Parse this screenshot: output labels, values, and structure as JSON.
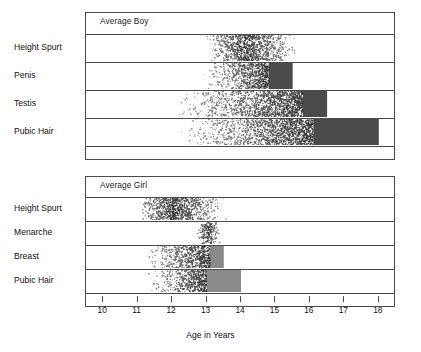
{
  "figure": {
    "axis_title": "Age in Years",
    "x_min": 9.5,
    "x_max": 18.5,
    "ticks": [
      10,
      11,
      12,
      13,
      14,
      15,
      16,
      17,
      18
    ],
    "tick_labels": [
      "10",
      "11",
      "12",
      "13",
      "14",
      "15",
      "16",
      "17",
      "18"
    ],
    "colors": {
      "frame": "#4a4a4a",
      "stipple_light": "#d9d9d9",
      "solid_dark": "#4a4a4a",
      "solid_mid": "#8a8a8a",
      "background": "#ffffff"
    }
  },
  "panels": [
    {
      "id": "boy",
      "title": "Average Boy",
      "rows": [
        {
          "label": "Height Spurt",
          "start": 13.0,
          "peak_start": 13.8,
          "peak_end": 14.4,
          "end": 15.6,
          "style": "diffuse"
        },
        {
          "label": "Penis",
          "start": 12.9,
          "peak_start": 14.8,
          "peak_end": 15.5,
          "end": 15.5,
          "style": "ramp-solid"
        },
        {
          "label": "Testis",
          "start": 12.1,
          "peak_start": 15.8,
          "peak_end": 16.5,
          "end": 16.5,
          "style": "ramp-solid"
        },
        {
          "label": "Pubic Hair",
          "start": 12.2,
          "peak_start": 16.1,
          "peak_end": 18.0,
          "end": 18.0,
          "style": "ramp-solid"
        }
      ]
    },
    {
      "id": "girl",
      "title": "Average Girl",
      "rows": [
        {
          "label": "Height Spurt",
          "start": 11.0,
          "peak_start": 11.8,
          "peak_end": 12.2,
          "end": 13.6,
          "style": "diffuse"
        },
        {
          "label": "Menarche",
          "start": 12.7,
          "peak_start": 12.9,
          "peak_end": 13.2,
          "end": 13.4,
          "style": "diffuse"
        },
        {
          "label": "Breast",
          "start": 11.2,
          "peak_start": 13.1,
          "peak_end": 13.5,
          "end": 13.5,
          "style": "ramp-solid"
        },
        {
          "label": "Pubic Hair",
          "start": 11.3,
          "peak_start": 13.0,
          "peak_end": 14.0,
          "end": 14.0,
          "style": "ramp-solid"
        }
      ]
    }
  ],
  "chart_data": {
    "type": "bar",
    "title": "",
    "subtitle": "",
    "xlabel": "Age in Years",
    "ylabel": "",
    "xlim": [
      9.5,
      18.5
    ],
    "xticks": [
      10,
      11,
      12,
      13,
      14,
      15,
      16,
      17,
      18
    ],
    "grid": false,
    "legend": "none",
    "note": "Tanner-style maturation timing chart. Each horizontal band shows the age range over which an event occurs; stippled density fades in from the start age and a solid block marks the late/complete phase.",
    "series": [
      {
        "name": "Average Boy",
        "items": [
          {
            "event": "Height Spurt",
            "range_start": 13.0,
            "range_end": 15.6,
            "peak_start": 13.8,
            "peak_end": 14.4
          },
          {
            "event": "Penis",
            "range_start": 12.9,
            "range_end": 15.5,
            "peak_start": 14.8,
            "peak_end": 15.5
          },
          {
            "event": "Testis",
            "range_start": 12.1,
            "range_end": 16.5,
            "peak_start": 15.8,
            "peak_end": 16.5
          },
          {
            "event": "Pubic Hair",
            "range_start": 12.2,
            "range_end": 18.0,
            "peak_start": 16.1,
            "peak_end": 18.0
          }
        ]
      },
      {
        "name": "Average Girl",
        "items": [
          {
            "event": "Height Spurt",
            "range_start": 11.0,
            "range_end": 13.6,
            "peak_start": 11.8,
            "peak_end": 12.2
          },
          {
            "event": "Menarche",
            "range_start": 12.7,
            "range_end": 13.4,
            "peak_start": 12.9,
            "peak_end": 13.2
          },
          {
            "event": "Breast",
            "range_start": 11.2,
            "range_end": 13.5,
            "peak_start": 13.1,
            "peak_end": 13.5
          },
          {
            "event": "Pubic Hair",
            "range_start": 11.3,
            "range_end": 14.0,
            "peak_start": 13.0,
            "peak_end": 14.0
          }
        ]
      }
    ]
  }
}
